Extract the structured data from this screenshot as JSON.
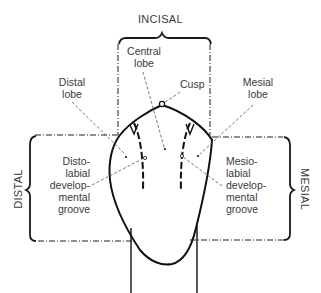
{
  "diagram": {
    "side_labels": {
      "incisal": "INCISAL",
      "distal": "DISTAL",
      "mesial": "MESIAL"
    },
    "labels": {
      "central_lobe": [
        "Central",
        "lobe"
      ],
      "distal_lobe": [
        "Distal",
        "lobe"
      ],
      "mesial_lobe": [
        "Mesial",
        "lobe"
      ],
      "cusp": "Cusp",
      "distolabial_groove": [
        "Disto-",
        "labial",
        "develop-",
        "mental",
        "groove"
      ],
      "mesiolabial_groove": [
        "Mesio-",
        "labial",
        "develop-",
        "mental",
        "groove"
      ]
    },
    "colors": {
      "line": "#1a1a1a",
      "text": "#3a3a3a",
      "background": "#ffffff"
    }
  }
}
